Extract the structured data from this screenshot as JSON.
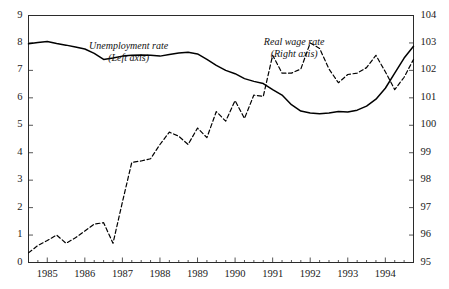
{
  "chart_data": {
    "type": "line",
    "title": "",
    "subtitle": "",
    "xlabel": "",
    "ylabel": "",
    "grid": false,
    "legend_position": "inline-annotation",
    "xlim": [
      1984.5,
      1994.75
    ],
    "x_tick_labels": [
      "1985",
      "1986",
      "1987",
      "1988",
      "1989",
      "1990",
      "1991",
      "1992",
      "1993",
      "1994"
    ],
    "x_tick_values": [
      1985,
      1986,
      1987,
      1988,
      1989,
      1990,
      1991,
      1992,
      1993,
      1994
    ],
    "x_minor_tick_step": 0.25,
    "axes": [
      {
        "id": "left",
        "name": "Unemployment rate",
        "side": "left",
        "ylim": [
          0,
          9
        ],
        "tick_labels": [
          "0",
          "1",
          "2",
          "3",
          "4",
          "5",
          "6",
          "7",
          "8",
          "9"
        ],
        "tick_values": [
          0,
          1,
          2,
          3,
          4,
          5,
          6,
          7,
          8,
          9
        ]
      },
      {
        "id": "right",
        "name": "Real wage rate",
        "side": "right",
        "ylim": [
          95,
          104
        ],
        "tick_labels": [
          "95",
          "96",
          "97",
          "98",
          "99",
          "100",
          "101",
          "102",
          "103",
          "104"
        ],
        "tick_values": [
          95,
          96,
          97,
          98,
          99,
          100,
          101,
          102,
          103,
          104
        ]
      }
    ],
    "annotations": [
      {
        "id": "unemployment-legend",
        "lines": [
          "Unemployment rate",
          "(Left axis)"
        ],
        "x": 0.26,
        "y": 0.1,
        "style": "italic"
      },
      {
        "id": "realwage-legend",
        "lines": [
          "Real wage rate",
          "(Right axis)"
        ],
        "x": 0.69,
        "y": 0.085,
        "style": "italic"
      }
    ],
    "series": [
      {
        "name": "Unemployment rate",
        "axis": "left",
        "style": "solid",
        "color": "#000000",
        "width": 1.5,
        "x": [
          1984.5,
          1984.75,
          1985.0,
          1985.25,
          1985.5,
          1985.75,
          1986.0,
          1986.25,
          1986.5,
          1986.75,
          1987.0,
          1987.25,
          1987.5,
          1987.75,
          1988.0,
          1988.25,
          1988.5,
          1988.75,
          1989.0,
          1989.25,
          1989.5,
          1989.75,
          1990.0,
          1990.25,
          1990.5,
          1990.75,
          1991.0,
          1991.25,
          1991.5,
          1991.75,
          1992.0,
          1992.25,
          1992.5,
          1992.75,
          1993.0,
          1993.25,
          1993.5,
          1993.75,
          1994.0,
          1994.25,
          1994.5,
          1994.75
        ],
        "values": [
          7.97,
          8.02,
          8.05,
          7.98,
          7.92,
          7.85,
          7.78,
          7.62,
          7.4,
          7.45,
          7.52,
          7.55,
          7.56,
          7.55,
          7.52,
          7.58,
          7.63,
          7.66,
          7.6,
          7.4,
          7.18,
          7.0,
          6.88,
          6.7,
          6.6,
          6.52,
          6.3,
          6.1,
          5.75,
          5.52,
          5.45,
          5.42,
          5.45,
          5.5,
          5.48,
          5.55,
          5.7,
          5.95,
          6.35,
          6.9,
          7.45,
          7.88
        ]
      },
      {
        "name": "Real wage rate",
        "axis": "right",
        "style": "dashed",
        "color": "#000000",
        "width": 1.2,
        "x": [
          1984.5,
          1984.75,
          1985.0,
          1985.25,
          1985.5,
          1985.75,
          1986.0,
          1986.25,
          1986.5,
          1986.75,
          1987.0,
          1987.25,
          1987.5,
          1987.75,
          1988.0,
          1988.25,
          1988.5,
          1988.75,
          1989.0,
          1989.25,
          1989.5,
          1989.75,
          1990.0,
          1990.25,
          1990.5,
          1990.75,
          1991.0,
          1991.25,
          1991.5,
          1991.75,
          1992.0,
          1992.25,
          1992.5,
          1992.75,
          1993.0,
          1993.25,
          1993.5,
          1993.75,
          1994.0,
          1994.25,
          1994.5,
          1994.75
        ],
        "values": [
          95.35,
          95.62,
          95.8,
          96.0,
          95.7,
          95.9,
          96.15,
          96.4,
          96.45,
          95.7,
          97.2,
          98.65,
          98.7,
          98.78,
          99.3,
          99.75,
          99.6,
          99.3,
          99.9,
          99.55,
          100.5,
          100.15,
          100.9,
          100.25,
          101.1,
          101.05,
          102.55,
          101.9,
          101.9,
          102.05,
          103.0,
          102.8,
          102.05,
          101.55,
          101.85,
          101.9,
          102.1,
          102.55,
          101.95,
          101.3,
          101.75,
          102.4
        ]
      }
    ]
  }
}
